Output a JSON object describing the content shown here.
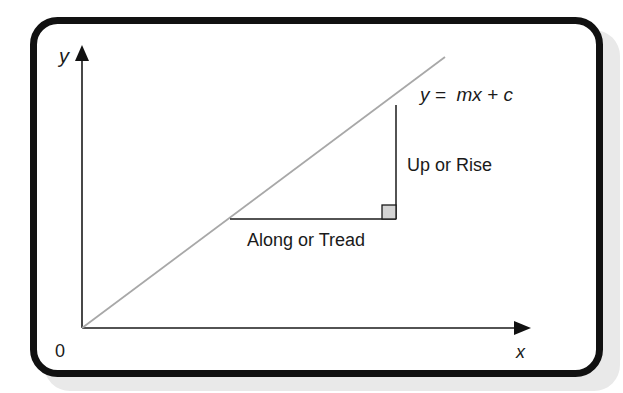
{
  "diagram": {
    "axes": {
      "y_label": "y",
      "x_label": "x",
      "origin_label": "0"
    },
    "line": {
      "equation": "y =  mx + c",
      "color": "#a8a8a8"
    },
    "triangle": {
      "rise_label": "Up or Rise",
      "tread_label": "Along or Tread",
      "right_angle_fill": "#d4d4d4"
    },
    "frame": {
      "border_color": "#111111",
      "shadow_color": "#e6e6e6"
    }
  }
}
